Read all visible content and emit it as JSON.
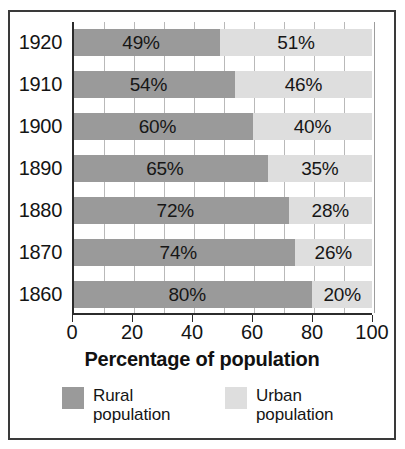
{
  "chart_data": {
    "type": "bar",
    "orientation": "horizontal",
    "stacked": true,
    "title": "",
    "xlabel": "Percentage of population",
    "ylabel": "",
    "xlim": [
      0,
      100
    ],
    "xticks": [
      0,
      20,
      40,
      60,
      80,
      100
    ],
    "xtick_labels": [
      "0",
      "20",
      "40",
      "60",
      "80",
      "100"
    ],
    "gridlines": [
      10,
      20,
      30,
      40,
      50,
      60,
      70,
      80,
      90,
      100
    ],
    "grid": true,
    "categories": [
      "1920",
      "1910",
      "1900",
      "1890",
      "1880",
      "1870",
      "1860"
    ],
    "series": [
      {
        "name": "Rural population",
        "color": "#9a9a9a",
        "values": [
          49,
          54,
          60,
          65,
          72,
          74,
          80
        ],
        "labels": [
          "49%",
          "54%",
          "60%",
          "65%",
          "72%",
          "74%",
          "80%"
        ]
      },
      {
        "name": "Urban population",
        "color": "#dedede",
        "values": [
          51,
          46,
          40,
          35,
          28,
          26,
          20
        ],
        "labels": [
          "51%",
          "46%",
          "40%",
          "35%",
          "28%",
          "26%",
          "20%"
        ]
      }
    ],
    "legend": {
      "position": "bottom",
      "entries": [
        {
          "label": "Rural\npopulation",
          "color": "#9a9a9a"
        },
        {
          "label": "Urban\npopulation",
          "color": "#dedede"
        }
      ]
    }
  }
}
